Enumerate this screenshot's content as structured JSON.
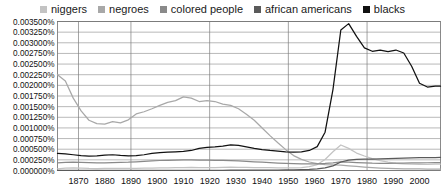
{
  "chart_data": {
    "type": "line",
    "title": "",
    "subtitle": "",
    "xlabel": "",
    "ylabel": "",
    "xlim": [
      1862,
      2008
    ],
    "ylim": [
      0.0,
      0.0035
    ],
    "grid": true,
    "legend_position": "top-center",
    "ytick_labels": [
      "0.003500%",
      "0.003250%",
      "0.003000%",
      "0.002750%",
      "0.002500%",
      "0.002250%",
      "0.002000%",
      "0.001750%",
      "0.001500%",
      "0.001250%",
      "0.001000%",
      "0.000750%",
      "0.000500%",
      "0.000250%",
      "0.000000%"
    ],
    "ytick_values": [
      0.0035,
      0.00325,
      0.003,
      0.00275,
      0.0025,
      0.00225,
      0.002,
      0.00175,
      0.0015,
      0.00125,
      0.001,
      0.00075,
      0.0005,
      0.00025,
      0.0
    ],
    "xtick_labels": [
      "1870",
      "1880",
      "1890",
      "1900",
      "1910",
      "1920",
      "1930",
      "1940",
      "1950",
      "1960",
      "1970",
      "1980",
      "1990",
      "2000"
    ],
    "xtick_values": [
      1870,
      1880,
      1890,
      1900,
      1910,
      1920,
      1930,
      1940,
      1950,
      1960,
      1970,
      1980,
      1990,
      2000
    ],
    "x": [
      1862,
      1865,
      1868,
      1871,
      1874,
      1877,
      1880,
      1883,
      1886,
      1889,
      1892,
      1895,
      1898,
      1901,
      1904,
      1907,
      1910,
      1913,
      1916,
      1919,
      1922,
      1925,
      1928,
      1931,
      1934,
      1937,
      1940,
      1943,
      1946,
      1949,
      1952,
      1955,
      1958,
      1961,
      1964,
      1967,
      1970,
      1973,
      1976,
      1979,
      1982,
      1985,
      1988,
      1991,
      1994,
      1997,
      2000,
      2003,
      2006,
      2008
    ],
    "series": [
      {
        "name": "niggers",
        "color": "#c3c3c3",
        "values": [
          4e-05,
          5.5e-05,
          6e-05,
          5.5e-05,
          4.8e-05,
          4.5e-05,
          5e-05,
          5.2e-05,
          5e-05,
          4.8e-05,
          5e-05,
          5.5e-05,
          5.8e-05,
          6e-05,
          6.2e-05,
          6.5e-05,
          7e-05,
          7.2e-05,
          7e-05,
          6.8e-05,
          7e-05,
          7.5e-05,
          7.8e-05,
          7.5e-05,
          7.2e-05,
          7e-05,
          6.8e-05,
          6.5e-05,
          6.2e-05,
          6e-05,
          6.2e-05,
          7e-05,
          9e-05,
          0.00014,
          0.00026,
          0.00044,
          0.0006,
          0.00052,
          0.00041,
          0.00034,
          0.00028,
          0.00023,
          0.000195,
          0.00017,
          0.000155,
          0.000148,
          0.000145,
          0.000145,
          0.000148,
          0.00015
        ]
      },
      {
        "name": "negroes",
        "color": "#a8a8a8",
        "values": [
          0.00225,
          0.0021,
          0.0017,
          0.0014,
          0.00118,
          0.0011,
          0.00109,
          0.00115,
          0.00112,
          0.00119,
          0.00133,
          0.00138,
          0.00145,
          0.00153,
          0.0016,
          0.00164,
          0.00173,
          0.0017,
          0.00162,
          0.00164,
          0.00162,
          0.00156,
          0.00153,
          0.00145,
          0.00132,
          0.00118,
          0.001,
          0.00082,
          0.00065,
          0.00049,
          0.00035,
          0.00026,
          0.0002,
          0.00016,
          0.00014,
          0.00013,
          0.000125,
          0.00011,
          9.5e-05,
          8e-05,
          6.8e-05,
          5.8e-05,
          5e-05,
          4.4e-05,
          4e-05,
          3.8e-05,
          3.6e-05,
          3.5e-05,
          3.5e-05,
          3.5e-05
        ]
      },
      {
        "name": "colored people",
        "color": "#8a8a8a",
        "values": [
          0.00018,
          0.00019,
          0.000195,
          0.00019,
          0.000185,
          0.00018,
          0.00018,
          0.000185,
          0.00019,
          0.000195,
          0.000205,
          0.000215,
          0.000225,
          0.000235,
          0.00024,
          0.000245,
          0.00025,
          0.000248,
          0.000245,
          0.000242,
          0.00024,
          0.000238,
          0.000232,
          0.000225,
          0.000215,
          0.000205,
          0.000195,
          0.000185,
          0.000175,
          0.000168,
          0.000162,
          0.000158,
          0.000156,
          0.000158,
          0.000165,
          0.00018,
          0.0002,
          0.000195,
          0.000185,
          0.000178,
          0.000172,
          0.00017,
          0.00017,
          0.000172,
          0.000175,
          0.000178,
          0.00018,
          0.000182,
          0.000184,
          0.000185
        ]
      },
      {
        "name": "african americans",
        "color": "#5a5a5a",
        "values": [
          5e-06,
          5e-06,
          5e-06,
          5e-06,
          5e-06,
          5e-06,
          5e-06,
          5e-06,
          5e-06,
          5e-06,
          5e-06,
          5e-06,
          5e-06,
          5e-06,
          5e-06,
          5e-06,
          5e-06,
          5e-06,
          5e-06,
          5e-06,
          5e-06,
          5e-06,
          6e-06,
          6e-06,
          6e-06,
          7e-06,
          8e-06,
          9e-06,
          1e-05,
          1.2e-05,
          1.4e-05,
          1.8e-05,
          2.4e-05,
          3.6e-05,
          6e-05,
          0.00011,
          0.0002,
          0.000245,
          0.00026,
          0.000265,
          0.00027,
          0.000275,
          0.00028,
          0.000285,
          0.00029,
          0.000295,
          0.0003,
          0.000302,
          0.000305,
          0.000306
        ]
      },
      {
        "name": "blacks",
        "color": "#111111",
        "values": [
          0.0004,
          0.00039,
          0.00037,
          0.00035,
          0.00034,
          0.000345,
          0.00036,
          0.00037,
          0.000355,
          0.000345,
          0.00035,
          0.00037,
          0.0004,
          0.00042,
          0.00043,
          0.00044,
          0.00045,
          0.00047,
          0.00052,
          0.000545,
          0.000555,
          0.00057,
          0.0006,
          0.00059,
          0.000555,
          0.00052,
          0.00049,
          0.00047,
          0.000455,
          0.00044,
          0.00043,
          0.00044,
          0.00047,
          0.00056,
          0.0009,
          0.0019,
          0.0033,
          0.00345,
          0.00315,
          0.00288,
          0.0028,
          0.00283,
          0.00279,
          0.00283,
          0.00276,
          0.00245,
          0.00205,
          0.00196,
          0.00198,
          0.00198
        ]
      }
    ]
  },
  "legend": {
    "items": [
      {
        "label": "niggers",
        "color": "#c3c3c3"
      },
      {
        "label": "negroes",
        "color": "#a8a8a8"
      },
      {
        "label": "colored people",
        "color": "#8a8a8a"
      },
      {
        "label": "african americans",
        "color": "#5a5a5a"
      },
      {
        "label": "blacks",
        "color": "#111111"
      }
    ]
  }
}
